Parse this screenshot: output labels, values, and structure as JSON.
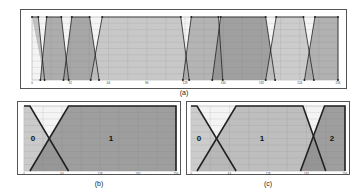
{
  "chart_data": [
    {
      "type": "area",
      "title": "",
      "panel_label": "(a)",
      "xlabel": "",
      "ylabel": "",
      "xlim": [
        0,
        256
      ],
      "ylim": [
        0,
        1
      ],
      "grid": true,
      "x_ticks": [
        "0",
        "32",
        "64",
        "96",
        "128",
        "160",
        "192",
        "224",
        "256"
      ],
      "series": [
        {
          "name": "MF1",
          "points": [
            [
              0,
              1
            ],
            [
              6,
              1
            ],
            [
              12,
              0
            ]
          ],
          "fill": "#b9b9b9"
        },
        {
          "name": "MF2",
          "points": [
            [
              8,
              0
            ],
            [
              14,
              1
            ],
            [
              28,
              1
            ],
            [
              35,
              0
            ]
          ],
          "fill": "#a0a0a0"
        },
        {
          "name": "MF3",
          "points": [
            [
              30,
              0
            ],
            [
              38,
              1
            ],
            [
              55,
              1
            ],
            [
              64,
              0
            ]
          ],
          "fill": "#999999"
        },
        {
          "name": "MF4",
          "points": [
            [
              56,
              0
            ],
            [
              67,
              1
            ],
            [
              142,
              1
            ],
            [
              150,
              0
            ]
          ],
          "fill": "#c0c0c0"
        },
        {
          "name": "MF5",
          "points": [
            [
              144,
              0
            ],
            [
              152,
              1
            ],
            [
              178,
              1
            ],
            [
              182,
              0
            ]
          ],
          "fill": "#a8a8a8"
        },
        {
          "name": "MF6",
          "points": [
            [
              172,
              0
            ],
            [
              180,
              1
            ],
            [
              223,
              1
            ],
            [
              232,
              0
            ]
          ],
          "fill": "#909090"
        },
        {
          "name": "MF7",
          "points": [
            [
              223,
              0
            ],
            [
              233,
              1
            ],
            [
              259,
              1
            ],
            [
              269,
              0
            ]
          ],
          "fill": "#c4c4c4"
        },
        {
          "name": "MF8",
          "points": [
            [
              260,
              0
            ],
            [
              270,
              1
            ],
            [
              292,
              1
            ],
            [
              292,
              0
            ]
          ],
          "fill": "#a4a4a4"
        }
      ]
    },
    {
      "type": "area",
      "title": "",
      "panel_label": "(b)",
      "xlim": [
        0,
        256
      ],
      "ylim": [
        0,
        1
      ],
      "grid": true,
      "x_ticks": [
        "0",
        "64",
        "128",
        "192",
        "256"
      ],
      "series": [
        {
          "name": "0",
          "points": [
            [
              0,
              1
            ],
            [
              10,
              1
            ],
            [
              75,
              0
            ],
            [
              0,
              0
            ]
          ],
          "fill": "#c2c2c2"
        },
        {
          "name": "1",
          "points": [
            [
              10,
              0
            ],
            [
              75,
              1
            ],
            [
              256,
              1
            ],
            [
              256,
              0
            ]
          ],
          "fill": "#8e8e8e"
        }
      ]
    },
    {
      "type": "area",
      "title": "",
      "panel_label": "(c)",
      "xlim": [
        0,
        256
      ],
      "ylim": [
        0,
        1
      ],
      "grid": true,
      "x_ticks": [
        "0",
        "64",
        "128",
        "192",
        "256"
      ],
      "series": [
        {
          "name": "0",
          "points": [
            [
              0,
              1
            ],
            [
              10,
              1
            ],
            [
              75,
              0
            ],
            [
              0,
              0
            ]
          ],
          "fill": "#c4c4c4"
        },
        {
          "name": "1",
          "points": [
            [
              10,
              0
            ],
            [
              75,
              1
            ],
            [
              186,
              1
            ],
            [
              224,
              0
            ]
          ],
          "fill": "#b4b4b4"
        },
        {
          "name": "2",
          "points": [
            [
              182,
              0
            ],
            [
              222,
              1
            ],
            [
              256,
              1
            ],
            [
              256,
              0
            ]
          ],
          "fill": "#8e8e8e"
        }
      ]
    }
  ],
  "captions": {
    "a": "(a)",
    "b": "(b)",
    "c": "(c)"
  },
  "labels_b": [
    "0",
    "1"
  ],
  "labels_c": [
    "0",
    "1",
    "2"
  ]
}
